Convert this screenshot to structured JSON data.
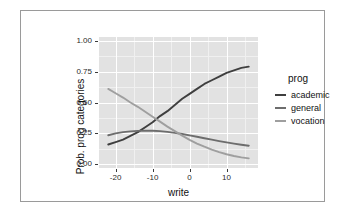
{
  "chart_data": {
    "type": "line",
    "title": "",
    "xlabel": "write",
    "ylabel": "Prob. prog categories",
    "xlim": [
      -24.5,
      18.5
    ],
    "ylim": [
      -0.03,
      1.03
    ],
    "xticks": [
      -20,
      -10,
      0,
      10
    ],
    "xtick_labels": [
      "-20",
      "-10",
      "0",
      "10"
    ],
    "yticks": [
      0.0,
      0.25,
      0.5,
      0.75,
      1.0
    ],
    "ytick_labels": [
      "0.00",
      "0.25",
      "0.50",
      "0.75",
      "1.00"
    ],
    "grid": true,
    "grid_major_color": "#ffffff",
    "grid_minor_color": "#f0f0f0",
    "panel_background": "#e2e2e2",
    "legend_position": "right",
    "legend_title": "prog",
    "x": [
      -22,
      -20,
      -18,
      -16,
      -14,
      -12,
      -10,
      -8,
      -6,
      -4,
      -2,
      0,
      2,
      4,
      6,
      8,
      10,
      12,
      14,
      16
    ],
    "series": [
      {
        "name": "academic",
        "color": "#3f3f3f",
        "values": [
          0.16,
          0.18,
          0.2,
          0.23,
          0.26,
          0.3,
          0.34,
          0.39,
          0.43,
          0.48,
          0.53,
          0.57,
          0.61,
          0.65,
          0.68,
          0.71,
          0.74,
          0.76,
          0.78,
          0.79
        ]
      },
      {
        "name": "general",
        "color": "#6d6d6d",
        "values": [
          0.235,
          0.25,
          0.26,
          0.266,
          0.27,
          0.272,
          0.272,
          0.268,
          0.262,
          0.254,
          0.245,
          0.234,
          0.223,
          0.211,
          0.2,
          0.188,
          0.177,
          0.167,
          0.158,
          0.15
        ]
      },
      {
        "name": "vocation",
        "color": "#9f9f9f",
        "values": [
          0.61,
          0.575,
          0.54,
          0.5,
          0.465,
          0.425,
          0.385,
          0.345,
          0.305,
          0.268,
          0.232,
          0.198,
          0.168,
          0.142,
          0.118,
          0.098,
          0.081,
          0.067,
          0.056,
          0.048
        ]
      }
    ]
  },
  "axes": {
    "x_title": "write",
    "y_title": "Prob. prog categories"
  },
  "legend": {
    "title": "prog",
    "entries": [
      {
        "label": "academic",
        "color": "#3f3f3f"
      },
      {
        "label": "general",
        "color": "#6d6d6d"
      },
      {
        "label": "vocation",
        "color": "#9f9f9f"
      }
    ]
  }
}
